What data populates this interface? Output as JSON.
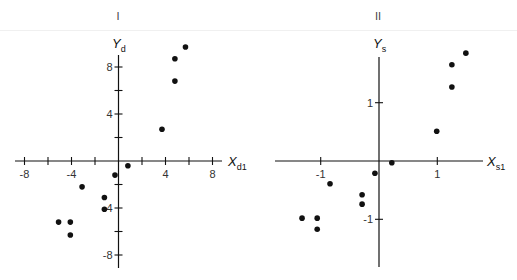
{
  "figure": {
    "panels": [
      {
        "title": "I"
      },
      {
        "title": "II"
      }
    ]
  },
  "chart_data": [
    {
      "type": "scatter",
      "title": "I",
      "xlabel": "X_d1",
      "ylabel": "Y_d",
      "xlim": [
        -9,
        9
      ],
      "ylim": [
        -9,
        9
      ],
      "xticks": [
        -8,
        -6,
        -4,
        -2,
        0,
        2,
        4,
        6,
        8
      ],
      "xtick_labels": [
        "-8",
        "",
        "-4",
        "",
        "",
        "",
        "4",
        "",
        "8"
      ],
      "yticks": [
        -8,
        -6,
        -4,
        -2,
        2,
        4,
        6,
        8
      ],
      "ytick_labels": [
        "-8",
        "",
        "-4",
        "",
        "",
        "4",
        "",
        "8"
      ],
      "grid": false,
      "points": [
        {
          "x": 5.7,
          "y": 9.7
        },
        {
          "x": 4.8,
          "y": 8.7
        },
        {
          "x": 4.8,
          "y": 6.8
        },
        {
          "x": 3.7,
          "y": 2.7
        },
        {
          "x": 0.8,
          "y": -0.4
        },
        {
          "x": -0.3,
          "y": -1.2
        },
        {
          "x": -3.1,
          "y": -2.2
        },
        {
          "x": -1.2,
          "y": -3.1
        },
        {
          "x": -1.2,
          "y": -4.1
        },
        {
          "x": -5.1,
          "y": -5.2
        },
        {
          "x": -4.1,
          "y": -5.2
        },
        {
          "x": -4.1,
          "y": -6.3
        }
      ]
    },
    {
      "type": "scatter",
      "title": "II",
      "xlabel": "X_s1",
      "ylabel": "Y_s",
      "xlim": [
        -1.8,
        1.8
      ],
      "ylim": [
        -1.8,
        1.8
      ],
      "xticks": [
        -1,
        1
      ],
      "xtick_labels": [
        "-1",
        "1"
      ],
      "yticks": [
        -1,
        1
      ],
      "ytick_labels": [
        "-1",
        "1"
      ],
      "grid": false,
      "points": [
        {
          "x": 1.49,
          "y": 1.85
        },
        {
          "x": 1.25,
          "y": 1.65
        },
        {
          "x": 1.25,
          "y": 1.27
        },
        {
          "x": 0.99,
          "y": 0.51
        },
        {
          "x": 0.22,
          "y": -0.03
        },
        {
          "x": -0.07,
          "y": -0.21
        },
        {
          "x": -0.84,
          "y": -0.39
        },
        {
          "x": -0.29,
          "y": -0.58
        },
        {
          "x": -0.29,
          "y": -0.74
        },
        {
          "x": -1.32,
          "y": -0.98
        },
        {
          "x": -1.06,
          "y": -0.98
        },
        {
          "x": -1.06,
          "y": -1.17
        }
      ]
    }
  ],
  "layout": {
    "panels": [
      {
        "origin": [
          118.5,
          161
        ],
        "scale": 11.75,
        "xaxis": [
          15,
          222
        ],
        "yaxis": [
          55,
          268
        ],
        "title_x": 118,
        "xlabel_pos": [
          228,
          166
        ],
        "ylabel_pos": [
          112,
          48
        ]
      },
      {
        "origin": [
          379,
          161
        ],
        "scale": 58.3,
        "xaxis": [
          275,
          483
        ],
        "yaxis": [
          57,
          267
        ],
        "title_x": 378,
        "xlabel_pos": [
          487,
          166
        ],
        "ylabel_pos": [
          373,
          48
        ]
      }
    ],
    "color": "#111111"
  }
}
